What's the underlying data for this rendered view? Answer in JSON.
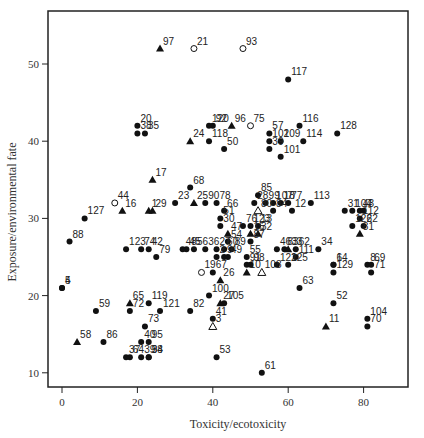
{
  "chart_data": {
    "type": "scatter",
    "title": "",
    "xlabel": "Toxicity/ecotoxicity",
    "ylabel": "Exposure/environmental fate",
    "xlim": [
      -4,
      92
    ],
    "ylim": [
      8,
      56
    ],
    "xticks": [
      0,
      20,
      40,
      60,
      80
    ],
    "yticks": [
      10,
      20,
      30,
      40,
      50
    ],
    "grid": false,
    "legend": null,
    "marker_types": {
      "dot": "filled circle",
      "tri": "filled triangle",
      "ring": "open circle",
      "otri": "open triangle"
    },
    "points": [
      {
        "label": "97",
        "x": 26,
        "y": 52,
        "m": "tri"
      },
      {
        "label": "21",
        "x": 35,
        "y": 52,
        "m": "ring"
      },
      {
        "label": "93",
        "x": 48,
        "y": 52,
        "m": "ring"
      },
      {
        "label": "117",
        "x": 60,
        "y": 48,
        "m": "dot"
      },
      {
        "label": "20",
        "x": 20,
        "y": 42,
        "m": "dot"
      },
      {
        "label": "38",
        "x": 20,
        "y": 41,
        "m": "dot"
      },
      {
        "label": "35",
        "x": 22,
        "y": 41,
        "m": "dot"
      },
      {
        "label": "120",
        "x": 39,
        "y": 42,
        "m": "dot"
      },
      {
        "label": "92",
        "x": 40,
        "y": 42,
        "m": "dot"
      },
      {
        "label": "96",
        "x": 45,
        "y": 42,
        "m": "tri"
      },
      {
        "label": "75",
        "x": 50,
        "y": 42,
        "m": "ring"
      },
      {
        "label": "116",
        "x": 63,
        "y": 42,
        "m": "dot"
      },
      {
        "label": "24",
        "x": 34,
        "y": 40,
        "m": "tri"
      },
      {
        "label": "118",
        "x": 39,
        "y": 40,
        "m": "dot"
      },
      {
        "label": "50",
        "x": 43,
        "y": 39,
        "m": "dot"
      },
      {
        "label": "57",
        "x": 55,
        "y": 41,
        "m": "dot"
      },
      {
        "label": "102",
        "x": 55,
        "y": 40,
        "m": "dot"
      },
      {
        "label": "109",
        "x": 58,
        "y": 40,
        "m": "dot"
      },
      {
        "label": "39",
        "x": 55,
        "y": 39,
        "m": "dot"
      },
      {
        "label": "114",
        "x": 64,
        "y": 40,
        "m": "dot"
      },
      {
        "label": "128",
        "x": 73,
        "y": 41,
        "m": "dot"
      },
      {
        "label": "101",
        "x": 58,
        "y": 38,
        "m": "dot"
      },
      {
        "label": "17",
        "x": 24,
        "y": 35,
        "m": "tri"
      },
      {
        "label": "68",
        "x": 34,
        "y": 34,
        "m": "dot"
      },
      {
        "label": "85",
        "x": 52,
        "y": 33,
        "m": "dot"
      },
      {
        "label": "44",
        "x": 14,
        "y": 32,
        "m": "ring"
      },
      {
        "label": "16",
        "x": 16,
        "y": 31,
        "m": "tri"
      },
      {
        "label": "1",
        "x": 23,
        "y": 31,
        "m": "tri"
      },
      {
        "label": "29",
        "x": 24,
        "y": 31,
        "m": "tri"
      },
      {
        "label": "23",
        "x": 30,
        "y": 32,
        "m": "dot"
      },
      {
        "label": "25",
        "x": 35,
        "y": 32,
        "m": "tri"
      },
      {
        "label": "90",
        "x": 38,
        "y": 32,
        "m": "dot"
      },
      {
        "label": "78",
        "x": 41,
        "y": 32,
        "m": "dot"
      },
      {
        "label": "66",
        "x": 43,
        "y": 31,
        "m": "dot"
      },
      {
        "label": "51",
        "x": 42,
        "y": 30,
        "m": "dot"
      },
      {
        "label": "28",
        "x": 51,
        "y": 32,
        "m": "dot"
      },
      {
        "label": "99",
        "x": 54,
        "y": 32,
        "m": "dot"
      },
      {
        "label": "107",
        "x": 56,
        "y": 32,
        "m": "dot"
      },
      {
        "label": "18",
        "x": 58,
        "y": 32,
        "m": "dot"
      },
      {
        "label": "80",
        "x": 52,
        "y": 31,
        "m": "otri"
      },
      {
        "label": "84",
        "x": 56,
        "y": 31,
        "m": "dot"
      },
      {
        "label": "77",
        "x": 60,
        "y": 32,
        "m": "dot"
      },
      {
        "label": "113",
        "x": 66,
        "y": 32,
        "m": "dot"
      },
      {
        "label": "12",
        "x": 61,
        "y": 31,
        "m": "dot"
      },
      {
        "label": "127",
        "x": 6,
        "y": 30,
        "m": "dot"
      },
      {
        "label": "104",
        "x": 77,
        "y": 31,
        "m": "dot"
      },
      {
        "label": "43",
        "x": 79,
        "y": 31,
        "m": "dot"
      },
      {
        "label": "7",
        "x": 80,
        "y": 31,
        "m": "dot"
      },
      {
        "label": "31",
        "x": 75,
        "y": 31,
        "m": "dot"
      },
      {
        "label": "112",
        "x": 79,
        "y": 30,
        "m": "dot"
      },
      {
        "label": "126",
        "x": 77,
        "y": 29,
        "m": "dot"
      },
      {
        "label": "22",
        "x": 80,
        "y": 29,
        "m": "dot"
      },
      {
        "label": "81",
        "x": 79,
        "y": 28,
        "m": "tri"
      },
      {
        "label": "76",
        "x": 48,
        "y": 29,
        "m": "dot"
      },
      {
        "label": "123",
        "x": 50,
        "y": 29,
        "m": "dot"
      },
      {
        "label": "13",
        "x": 52,
        "y": 29,
        "m": "dot"
      },
      {
        "label": "15",
        "x": 50,
        "y": 28,
        "m": "tri"
      },
      {
        "label": "32",
        "x": 52,
        "y": 28,
        "m": "tri"
      },
      {
        "label": "30",
        "x": 42,
        "y": 29,
        "m": "dot"
      },
      {
        "label": "47",
        "x": 44,
        "y": 28,
        "m": "tri"
      },
      {
        "label": "87",
        "x": 50,
        "y": 27,
        "m": "dot"
      },
      {
        "label": "88",
        "x": 2,
        "y": 27,
        "m": "dot"
      },
      {
        "label": "123b",
        "x": 17,
        "y": 26,
        "m": "dot"
      },
      {
        "label": "74",
        "x": 21,
        "y": 26,
        "m": "dot"
      },
      {
        "label": "42",
        "x": 23,
        "y": 26,
        "m": "dot"
      },
      {
        "label": "79",
        "x": 25,
        "y": 25,
        "m": "dot"
      },
      {
        "label": "54",
        "x": 44,
        "y": 27,
        "m": "dot"
      },
      {
        "label": "45",
        "x": 33,
        "y": 26,
        "m": "dot"
      },
      {
        "label": "48",
        "x": 32,
        "y": 26,
        "m": "dot"
      },
      {
        "label": "56",
        "x": 35,
        "y": 26,
        "m": "dot"
      },
      {
        "label": "36",
        "x": 38,
        "y": 26,
        "m": "dot"
      },
      {
        "label": "27",
        "x": 41,
        "y": 26,
        "m": "dot"
      },
      {
        "label": "60",
        "x": 43,
        "y": 26,
        "m": "dot"
      },
      {
        "label": "89",
        "x": 45,
        "y": 26,
        "m": "dot"
      },
      {
        "label": "2",
        "x": 41,
        "y": 25,
        "m": "dot"
      },
      {
        "label": "9",
        "x": 43,
        "y": 25,
        "m": "dot"
      },
      {
        "label": "49",
        "x": 44,
        "y": 25,
        "m": "dot"
      },
      {
        "label": "55",
        "x": 49,
        "y": 25,
        "m": "dot"
      },
      {
        "label": "91",
        "x": 49,
        "y": 24,
        "m": "dot"
      },
      {
        "label": "46",
        "x": 57,
        "y": 26,
        "m": "dot"
      },
      {
        "label": "83",
        "x": 59,
        "y": 26,
        "m": "dot"
      },
      {
        "label": "62",
        "x": 62,
        "y": 26,
        "m": "dot"
      },
      {
        "label": "33",
        "x": 60,
        "y": 26,
        "m": "tri"
      },
      {
        "label": "111",
        "x": 62,
        "y": 25,
        "m": "dot"
      },
      {
        "label": "34",
        "x": 68,
        "y": 26,
        "m": "dot"
      },
      {
        "label": "122",
        "x": 57,
        "y": 24,
        "m": "dot"
      },
      {
        "label": "125",
        "x": 60,
        "y": 24,
        "m": "dot"
      },
      {
        "label": "6",
        "x": 72,
        "y": 24,
        "m": "dot"
      },
      {
        "label": "14",
        "x": 72,
        "y": 24,
        "m": "dot"
      },
      {
        "label": "129",
        "x": 72,
        "y": 23,
        "m": "dot"
      },
      {
        "label": "8",
        "x": 81,
        "y": 24,
        "m": "dot"
      },
      {
        "label": "69",
        "x": 82,
        "y": 24,
        "m": "dot"
      },
      {
        "label": "71",
        "x": 82,
        "y": 23,
        "m": "dot"
      },
      {
        "label": "19",
        "x": 37,
        "y": 23,
        "m": "ring"
      },
      {
        "label": "67",
        "x": 40,
        "y": 23,
        "m": "dot"
      },
      {
        "label": "26",
        "x": 42,
        "y": 22,
        "m": "tri"
      },
      {
        "label": "10",
        "x": 49,
        "y": 23,
        "m": "tri"
      },
      {
        "label": "98",
        "x": 50,
        "y": 24,
        "m": "dot"
      },
      {
        "label": "108",
        "x": 53,
        "y": 23,
        "m": "otri"
      },
      {
        "label": "4",
        "x": 0,
        "y": 21,
        "m": "dot"
      },
      {
        "label": "5",
        "x": 0,
        "y": 21,
        "m": "dot"
      },
      {
        "label": "100",
        "x": 39,
        "y": 20,
        "m": "dot"
      },
      {
        "label": "63",
        "x": 63,
        "y": 21,
        "m": "dot"
      },
      {
        "label": "27b",
        "x": 42,
        "y": 19,
        "m": "tri"
      },
      {
        "label": "105",
        "x": 43,
        "y": 19,
        "m": "dot"
      },
      {
        "label": "65",
        "x": 18,
        "y": 19,
        "m": "tri"
      },
      {
        "label": "72",
        "x": 18,
        "y": 18,
        "m": "dot"
      },
      {
        "label": "119",
        "x": 23,
        "y": 19,
        "m": "dot"
      },
      {
        "label": "52",
        "x": 72,
        "y": 19,
        "m": "dot"
      },
      {
        "label": "59",
        "x": 9,
        "y": 18,
        "m": "dot"
      },
      {
        "label": "121",
        "x": 26,
        "y": 18,
        "m": "dot"
      },
      {
        "label": "82",
        "x": 34,
        "y": 18,
        "m": "dot"
      },
      {
        "label": "41",
        "x": 40,
        "y": 17,
        "m": "dot"
      },
      {
        "label": "3",
        "x": 40,
        "y": 16,
        "m": "otri"
      },
      {
        "label": "104b",
        "x": 81,
        "y": 17,
        "m": "dot"
      },
      {
        "label": "70",
        "x": 81,
        "y": 16,
        "m": "dot"
      },
      {
        "label": "11",
        "x": 70,
        "y": 16,
        "m": "tri"
      },
      {
        "label": "73",
        "x": 22,
        "y": 16,
        "m": "dot"
      },
      {
        "label": "58",
        "x": 4,
        "y": 14,
        "m": "tri"
      },
      {
        "label": "86",
        "x": 11,
        "y": 14,
        "m": "dot"
      },
      {
        "label": "40",
        "x": 21,
        "y": 14,
        "m": "dot"
      },
      {
        "label": "95",
        "x": 23,
        "y": 14,
        "m": "dot"
      },
      {
        "label": "37",
        "x": 17,
        "y": 12,
        "m": "dot"
      },
      {
        "label": "64",
        "x": 18,
        "y": 12,
        "m": "dot"
      },
      {
        "label": "39b",
        "x": 21,
        "y": 12,
        "m": "dot"
      },
      {
        "label": "38b",
        "x": 23,
        "y": 12,
        "m": "dot"
      },
      {
        "label": "94",
        "x": 23,
        "y": 12,
        "m": "dot"
      },
      {
        "label": "53",
        "x": 41,
        "y": 12,
        "m": "dot"
      },
      {
        "label": "61",
        "x": 53,
        "y": 10,
        "m": "dot"
      }
    ]
  },
  "labels": {
    "xlabel": "Toxicity/ecotoxicity",
    "ylabel": "Exposure/environmental fate"
  }
}
